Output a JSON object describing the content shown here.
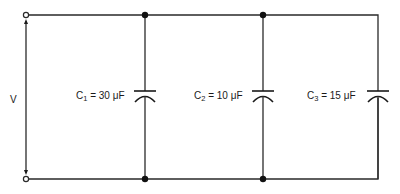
{
  "diagram": {
    "type": "parallel-capacitor-circuit",
    "source": {
      "label": "V"
    },
    "capacitors": [
      {
        "symbol": "C",
        "index": "1",
        "value": "30",
        "unit": "μF",
        "label": "C1 = 30 μF"
      },
      {
        "symbol": "C",
        "index": "2",
        "value": "10",
        "unit": "μF",
        "label": "C2 = 10 μF"
      },
      {
        "symbol": "C",
        "index": "3",
        "value": "15",
        "unit": "μF",
        "label": "C3 = 15 μF"
      }
    ],
    "equals": "=",
    "colors": {
      "line": "#2a2a2a",
      "background": "#ffffff"
    }
  }
}
